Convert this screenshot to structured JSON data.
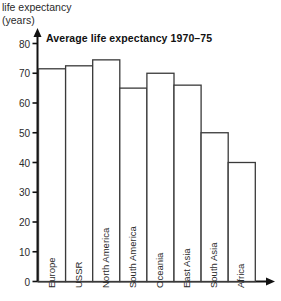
{
  "axis": {
    "y_caption_line1": "life expectancy",
    "y_caption_line2": "(years)",
    "y_ticks": [
      "0",
      "10",
      "20",
      "30",
      "40",
      "50",
      "60",
      "70",
      "80"
    ]
  },
  "title": "Average life expectancy 1970–75",
  "chart_data": {
    "type": "bar",
    "title": "Average life expectancy 1970–75",
    "categories": [
      "Europe",
      "USSR",
      "North America",
      "South America",
      "Oceania",
      "East Asia",
      "South Asia",
      "Africa"
    ],
    "values": [
      71.5,
      72.5,
      74.5,
      65,
      70,
      66,
      50,
      40
    ],
    "xlabel": "",
    "ylabel": "life expectancy (years)",
    "ylim": [
      0,
      80
    ],
    "ytick_step": 10,
    "grid": false,
    "legend": "none",
    "bar_fill": "#ffffff",
    "bar_stroke": "#3a3a3a"
  },
  "colors": {
    "axis": "#111111",
    "bar_outline": "#3a3a3a",
    "text": "#2a2a2a"
  }
}
